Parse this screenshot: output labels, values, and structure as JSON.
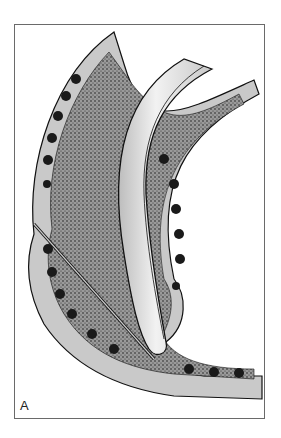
{
  "figure": {
    "panel_label": "A",
    "colors": {
      "wall_fill": "#c9c9c9",
      "mucosa_dark": "#1a1a1a",
      "stipple": "#5a5a5a",
      "tube_fill": "#e4e4e4",
      "outline": "#111111",
      "frame": "#6a6a6a"
    }
  }
}
